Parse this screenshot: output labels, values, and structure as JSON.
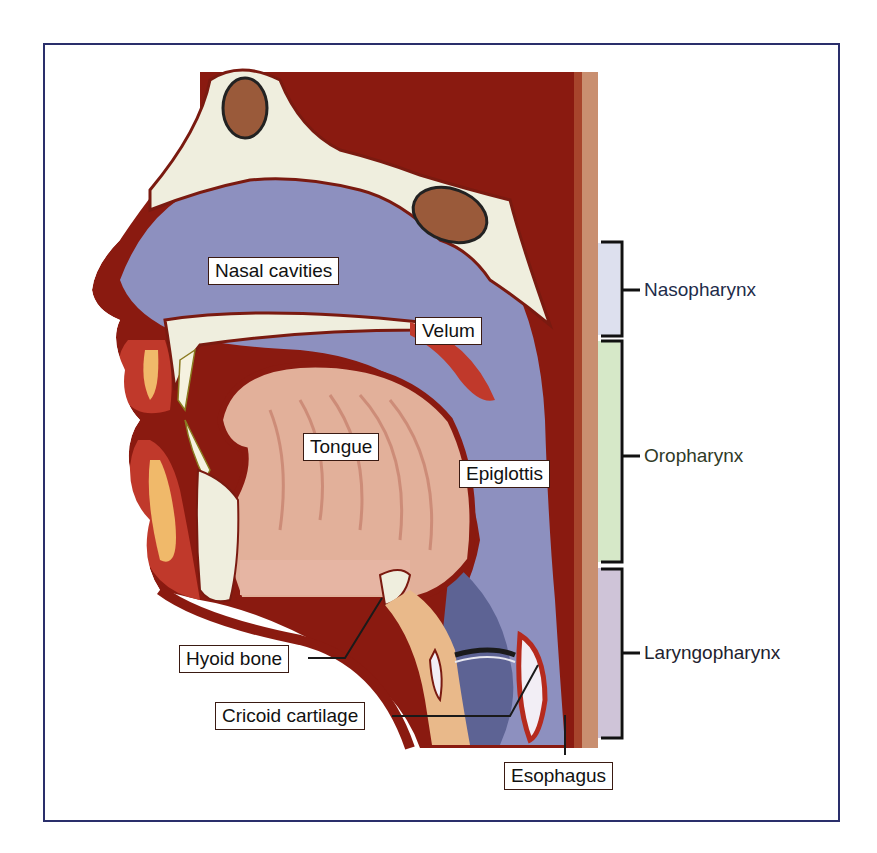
{
  "figure": {
    "labels": {
      "nasal_cavities": "Nasal cavities",
      "velum": "Velum",
      "tongue": "Tongue",
      "epiglottis": "Epiglottis",
      "hyoid_bone": "Hyoid bone",
      "cricoid_cartilage": "Cricoid cartilage",
      "esophagus": "Esophagus"
    },
    "regions": [
      {
        "name": "Nasopharynx",
        "color": "#dde0ee",
        "text_color": "#1e2c4a"
      },
      {
        "name": "Oropharynx",
        "color": "#d6e8c8",
        "text_color": "#2f3a26"
      },
      {
        "name": "Laryngopharynx",
        "color": "#cfc4d8",
        "text_color": "#22222e"
      }
    ],
    "colors": {
      "frame_border": "#2a2f6b",
      "tissue_dark_red": "#8a1a10",
      "airway_blue": "#8d90bf",
      "bone": "#efeede",
      "tongue": "#e2b09a"
    }
  }
}
